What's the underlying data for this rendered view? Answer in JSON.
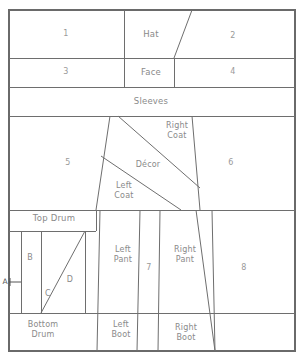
{
  "diagram": {
    "canvas": {
      "width": 304,
      "height": 361
    },
    "colors": {
      "background": "#ffffff",
      "line": "#6e6e6e",
      "frame": "#6a6a6a",
      "label_text": "#8a8a8a",
      "dimension_text": "#555555"
    },
    "pieces": [
      {
        "id": "p1",
        "label": "1",
        "x": 66,
        "y": 34
      },
      {
        "id": "hat",
        "label": "Hat",
        "x": 151,
        "y": 34
      },
      {
        "id": "p2",
        "label": "2",
        "x": 233,
        "y": 36
      },
      {
        "id": "p3",
        "label": "3",
        "x": 66,
        "y": 72
      },
      {
        "id": "face",
        "label": "Face",
        "x": 151,
        "y": 72
      },
      {
        "id": "p4",
        "label": "4",
        "x": 233,
        "y": 72
      },
      {
        "id": "slv",
        "label": "Sleeves",
        "x": 151,
        "y": 101
      },
      {
        "id": "p5",
        "label": "5",
        "x": 68,
        "y": 163
      },
      {
        "id": "rcoat",
        "label": "Right\nCoat",
        "x": 177,
        "y": 131
      },
      {
        "id": "decor",
        "label": "Décor",
        "x": 148,
        "y": 165
      },
      {
        "id": "lcoat",
        "label": "Left\nCoat",
        "x": 124,
        "y": 191
      },
      {
        "id": "p6",
        "label": "6",
        "x": 231,
        "y": 163
      },
      {
        "id": "tdrum",
        "label": "Top Drum",
        "x": 54,
        "y": 218
      },
      {
        "id": "bB",
        "label": "B",
        "x": 30,
        "y": 258
      },
      {
        "id": "bC",
        "label": "C",
        "x": 48,
        "y": 294
      },
      {
        "id": "bD",
        "label": "D",
        "x": 70,
        "y": 280
      },
      {
        "id": "lpant",
        "label": "Left\nPant",
        "x": 123,
        "y": 255
      },
      {
        "id": "p7",
        "label": "7",
        "x": 145,
        "y": 268
      },
      {
        "id": "rpant",
        "label": "Right\nPant",
        "x": 185,
        "y": 255
      },
      {
        "id": "p8",
        "label": "8",
        "x": 242,
        "y": 268
      },
      {
        "id": "bdrum",
        "label": "Bottom\nDrum",
        "x": 43,
        "y": 330
      },
      {
        "id": "lboot",
        "label": "Left\nBoot",
        "x": 121,
        "y": 330
      },
      {
        "id": "rboot",
        "label": "Right\nBoot",
        "x": 186,
        "y": 333
      }
    ],
    "dimensions": [
      {
        "id": "dimA",
        "label": "A",
        "x": 5,
        "y": 282
      }
    ],
    "geometry": {
      "frame": {
        "left": 9,
        "top": 10,
        "right": 295,
        "bottom": 351
      },
      "horizontal_rules": [
        58,
        87,
        116,
        210,
        231,
        313
      ],
      "vertical_rules": [
        {
          "x": 124,
          "y1": 10,
          "y2": 87
        },
        {
          "x": 174,
          "y1": 58,
          "y2": 87
        }
      ],
      "hat_diagonal": {
        "x1": 192,
        "y1": 10,
        "x2": 174,
        "y2": 58
      },
      "coat_block": {
        "left_top_x": 110,
        "left_bottom_x": 96,
        "right_top_x": 192,
        "right_bottom_x": 200,
        "top_y": 116,
        "bottom_y": 210
      },
      "coat_diagonals": [
        {
          "x1": 118,
          "y1": 116,
          "x2": 200,
          "y2": 188
        },
        {
          "x1": 101,
          "y1": 156,
          "x2": 181,
          "y2": 210
        }
      ],
      "lower_verticals": [
        {
          "x": 41,
          "y1": 231,
          "y2": 313
        },
        {
          "x": 85,
          "y1": 231,
          "y2": 313
        },
        {
          "x": 100,
          "y1": 210,
          "y2": 351
        },
        {
          "x": 140,
          "y1": 210,
          "y2": 351
        },
        {
          "x": 160,
          "y1": 210,
          "y2": 351
        },
        {
          "x": 212,
          "y1": 210,
          "y2": 351
        }
      ],
      "drum_triangle": {
        "x1": 41,
        "y1": 313,
        "x2": 85,
        "y2": 231
      },
      "pant_slant": {
        "x1": 196,
        "y1": 210,
        "x2": 215,
        "y2": 351
      },
      "top_drum_right_x": 96
    }
  }
}
